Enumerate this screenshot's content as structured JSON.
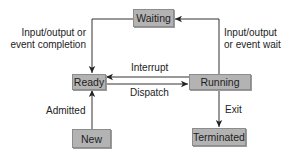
{
  "diagram": {
    "type": "state-transition",
    "title": "",
    "states": {
      "waiting": "Waiting",
      "ready": "Ready",
      "running": "Running",
      "new": "New",
      "terminated": "Terminated"
    },
    "transitions": {
      "io_completion": {
        "line1": "Input/output or",
        "line2": "event completion",
        "from": "Waiting",
        "to": "Ready"
      },
      "io_wait": {
        "line1": "Input/output",
        "line2": "or event wait",
        "from": "Running",
        "to": "Waiting"
      },
      "interrupt": {
        "label": "Interrupt",
        "from": "Running",
        "to": "Ready"
      },
      "dispatch": {
        "label": "Dispatch",
        "from": "Ready",
        "to": "Running"
      },
      "admitted": {
        "label": "Admitted",
        "from": "New",
        "to": "Ready"
      },
      "exit": {
        "label": "Exit",
        "from": "Running",
        "to": "Terminated"
      }
    },
    "colors": {
      "box_fill": "#b3b3b3",
      "box_border": "#8c8c8c",
      "line": "#333333",
      "text": "#222222"
    }
  }
}
